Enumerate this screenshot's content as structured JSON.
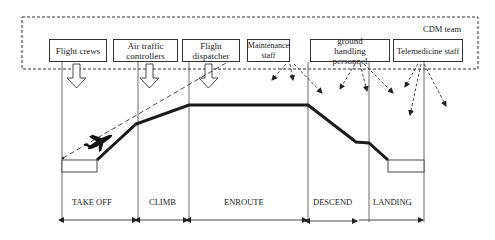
{
  "diagram": {
    "team_label": "CDM team",
    "stakeholders": [
      {
        "label": "Flight crews",
        "x": 49,
        "w": 58
      },
      {
        "label": "Air traffic controllers",
        "x": 113,
        "w": 65
      },
      {
        "label": "Flight dispatcher",
        "x": 182,
        "w": 58
      },
      {
        "label": "Maintenance staff",
        "x": 247,
        "w": 43
      },
      {
        "label": "ground handling personnel",
        "x": 310,
        "w": 80
      },
      {
        "label": "Telemedicine staff",
        "x": 393,
        "w": 70
      }
    ],
    "phases": [
      {
        "label": "TAKE OFF"
      },
      {
        "label": "CLIMB"
      },
      {
        "label": "ENROUTE"
      },
      {
        "label": "DESCEND"
      },
      {
        "label": "LANDING"
      }
    ],
    "colors": {
      "line": "#222222",
      "background": "#ffffff"
    }
  }
}
